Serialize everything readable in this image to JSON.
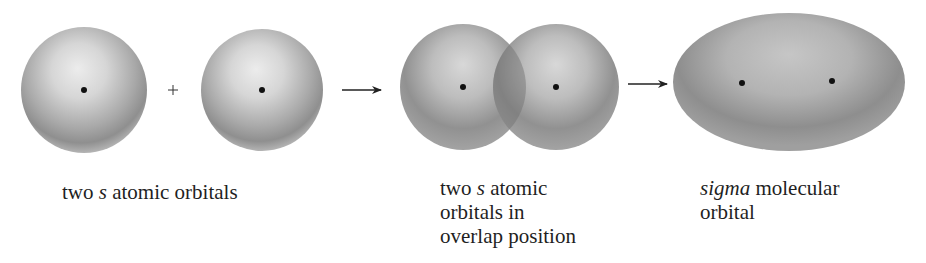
{
  "figure": {
    "stages": [
      {
        "id": "separate",
        "label_parts": [
          "two ",
          "s",
          " atomic orbitals"
        ],
        "label_lines": [
          "two s atomic orbitals"
        ]
      },
      {
        "id": "overlap",
        "label_parts": [
          "two ",
          "s",
          " atomic",
          "orbitals in",
          "overlap position"
        ],
        "label_lines": [
          "two s atomic",
          "orbitals in",
          "overlap position"
        ]
      },
      {
        "id": "sigma",
        "label_parts": [
          "sigma",
          " molecular",
          "orbital"
        ],
        "label_lines": [
          "sigma molecular",
          "orbital"
        ]
      }
    ],
    "operators": {
      "plus": "+",
      "arrow_count": 2
    },
    "colors": {
      "background": "#ffffff",
      "orbital_light": "#e6e6e6",
      "orbital_mid": "#a8a8a8",
      "orbital_dark": "#7c7c7c",
      "nucleus": "#111111",
      "text": "#1f1f1f"
    }
  }
}
